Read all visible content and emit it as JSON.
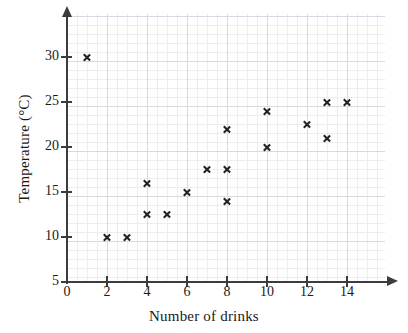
{
  "chart_data": {
    "type": "scatter",
    "title": "",
    "xlabel": "Number of drinks",
    "ylabel": "Temperature (°C)",
    "xlim": [
      0,
      16
    ],
    "ylim": [
      5,
      35
    ],
    "xticks": [
      0,
      2,
      4,
      6,
      8,
      10,
      12,
      14
    ],
    "yticks": [
      5,
      10,
      15,
      20,
      25,
      30
    ],
    "xtick_labels": [
      "0",
      "2",
      "4",
      "6",
      "8",
      "10",
      "12",
      "14"
    ],
    "ytick_labels": [
      "5",
      "10",
      "15",
      "20",
      "25",
      "30"
    ],
    "grid": true,
    "grid_color": "#d9d9e3",
    "legend": null,
    "marker": "x",
    "marker_color": "#222222",
    "axis_color": "#3c3c3c",
    "points": [
      {
        "x": 1,
        "y": 30
      },
      {
        "x": 2,
        "y": 10
      },
      {
        "x": 3,
        "y": 10
      },
      {
        "x": 4,
        "y": 16
      },
      {
        "x": 4,
        "y": 12.5
      },
      {
        "x": 5,
        "y": 12.5
      },
      {
        "x": 6,
        "y": 15
      },
      {
        "x": 7,
        "y": 17.5
      },
      {
        "x": 8,
        "y": 22
      },
      {
        "x": 8,
        "y": 17.5
      },
      {
        "x": 8,
        "y": 14
      },
      {
        "x": 10,
        "y": 24
      },
      {
        "x": 10,
        "y": 20
      },
      {
        "x": 12,
        "y": 22.5
      },
      {
        "x": 13,
        "y": 25
      },
      {
        "x": 13,
        "y": 21
      },
      {
        "x": 14,
        "y": 25
      }
    ]
  }
}
